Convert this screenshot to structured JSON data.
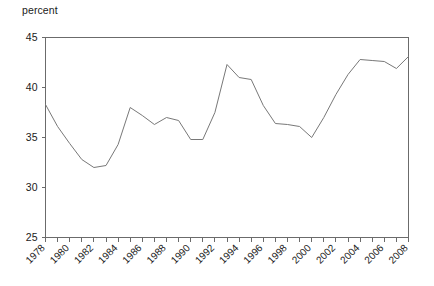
{
  "chart_data": {
    "type": "line",
    "title": "",
    "subtitle": "",
    "xlabel": "",
    "ylabel": "percent",
    "unit_label": "percent",
    "xlim": [
      1978,
      2008
    ],
    "ylim": [
      25,
      45
    ],
    "grid": false,
    "legend": null,
    "legend_position": "none",
    "y_ticks": [
      25,
      30,
      35,
      40,
      45
    ],
    "y_tick_labels": [
      "25",
      "30",
      "35",
      "40",
      "45"
    ],
    "x_ticks": [
      1978,
      1979,
      1980,
      1981,
      1982,
      1983,
      1984,
      1985,
      1986,
      1987,
      1988,
      1989,
      1990,
      1991,
      1992,
      1993,
      1994,
      1995,
      1996,
      1997,
      1998,
      1999,
      2000,
      2001,
      2002,
      2003,
      2004,
      2005,
      2006,
      2007,
      2008
    ],
    "x_tick_labels": [
      "1978",
      "1980",
      "1982",
      "1984",
      "1986",
      "1988",
      "1990",
      "1992",
      "1994",
      "1996",
      "1998",
      "2000",
      "2002",
      "2004",
      "2006",
      "2008"
    ],
    "x_tick_label_years": [
      1978,
      1980,
      1982,
      1984,
      1986,
      1988,
      1990,
      1992,
      1994,
      1996,
      1998,
      2000,
      2002,
      2004,
      2006,
      2008
    ],
    "x_tick_label_rotation": -45,
    "series": [
      {
        "name": "percent",
        "color": "#787878",
        "x": [
          1978,
          1979,
          1980,
          1981,
          1982,
          1983,
          1984,
          1985,
          1986,
          1987,
          1988,
          1989,
          1990,
          1991,
          1992,
          1993,
          1994,
          1995,
          1996,
          1997,
          1998,
          1999,
          2000,
          2001,
          2002,
          2003,
          2004,
          2005,
          2006,
          2007,
          2008
        ],
        "values": [
          38.3,
          36.1,
          34.4,
          32.8,
          32.0,
          32.2,
          34.3,
          38.0,
          37.2,
          36.3,
          37.0,
          36.7,
          34.8,
          34.8,
          37.5,
          42.3,
          41.0,
          40.8,
          38.2,
          36.4,
          36.3,
          36.1,
          35.0,
          37.0,
          39.3,
          41.3,
          42.8,
          42.7,
          42.6,
          41.9,
          43.1
        ]
      }
    ]
  }
}
